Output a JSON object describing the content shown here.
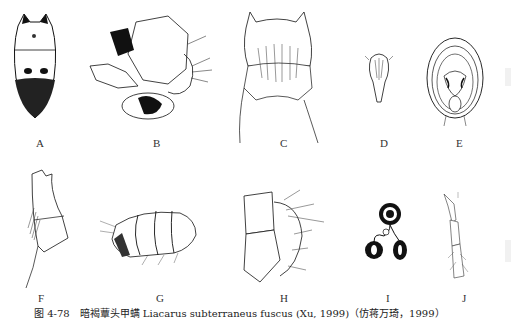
{
  "figure": {
    "panels": [
      {
        "id": "A",
        "label": "A"
      },
      {
        "id": "B",
        "label": "B"
      },
      {
        "id": "C",
        "label": "C"
      },
      {
        "id": "D",
        "label": "D"
      },
      {
        "id": "E",
        "label": "E"
      },
      {
        "id": "F",
        "label": "F"
      },
      {
        "id": "G",
        "label": "G"
      },
      {
        "id": "H",
        "label": "H"
      },
      {
        "id": "I",
        "label": "I"
      },
      {
        "id": "J",
        "label": "J"
      }
    ],
    "caption": "图 4-78　暗褐蕈头甲螨 Liacarus subterraneus fuscus (Xu, 1999)（仿蒋万琦，1999）"
  }
}
